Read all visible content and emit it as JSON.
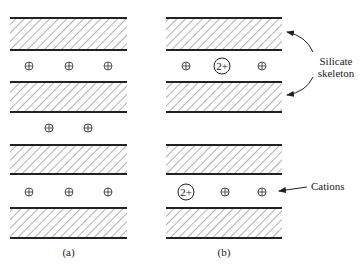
{
  "figure": {
    "panels": [
      {
        "id": "a",
        "caption": "(a)",
        "x": 10,
        "width": 117,
        "slabs": [
          {
            "y": 18,
            "h": 32
          },
          {
            "y": 82,
            "h": 30
          },
          {
            "y": 145,
            "h": 29
          },
          {
            "y": 208,
            "h": 30
          }
        ],
        "cation_rows": [
          {
            "y": 66,
            "ions": [
              {
                "x": 29,
                "charge": "+"
              },
              {
                "x": 69,
                "charge": "+"
              },
              {
                "x": 108,
                "charge": "+"
              }
            ]
          },
          {
            "y": 128,
            "ions": [
              {
                "x": 49,
                "charge": "+"
              },
              {
                "x": 88,
                "charge": "+"
              }
            ]
          },
          {
            "y": 192,
            "ions": [
              {
                "x": 29,
                "charge": "+"
              },
              {
                "x": 69,
                "charge": "+"
              },
              {
                "x": 108,
                "charge": "+"
              }
            ]
          }
        ]
      },
      {
        "id": "b",
        "caption": "(b)",
        "x": 166,
        "width": 116,
        "slabs": [
          {
            "y": 18,
            "h": 32
          },
          {
            "y": 82,
            "h": 30
          },
          {
            "y": 145,
            "h": 29
          },
          {
            "y": 208,
            "h": 30
          }
        ],
        "cation_rows": [
          {
            "y": 66,
            "ions": [
              {
                "x": 186,
                "charge": "+"
              },
              {
                "x": 222,
                "charge": "2+"
              },
              {
                "x": 262,
                "charge": "+"
              }
            ]
          },
          {
            "y": 192,
            "ions": [
              {
                "x": 186,
                "charge": "2+"
              },
              {
                "x": 225,
                "charge": "+"
              },
              {
                "x": 262,
                "charge": "+"
              }
            ]
          }
        ]
      }
    ],
    "annotations": {
      "silicate_line1": "Silicate",
      "silicate_line2": "skeleton",
      "cations": "Cations"
    },
    "colors": {
      "line": "#222222",
      "hatch": "#555555",
      "background": "#ffffff"
    }
  }
}
